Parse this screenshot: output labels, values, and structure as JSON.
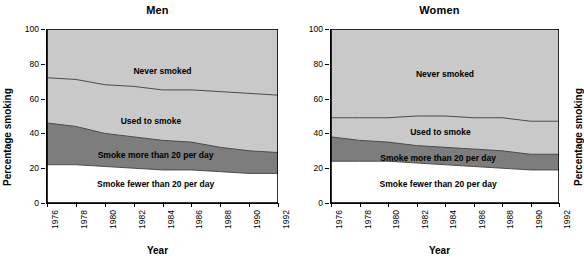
{
  "figure": {
    "width": 569,
    "height": 268,
    "background": "#ffffff"
  },
  "colors": {
    "never_smoked": "#c9c9c9",
    "used_to_smoke": "#c9c9c9",
    "smoke_more_than_20": "#7d7d7d",
    "smoke_fewer_than_20": "#ffffff",
    "axis": "#000000",
    "boundary_line": "#4a4a4a"
  },
  "panels": [
    {
      "id": "men",
      "title": "Men",
      "xlabel": "Year",
      "ylabel": "Percentage smoking"
    },
    {
      "id": "women",
      "title": "Women",
      "xlabel": "Year",
      "ylabel": "Percentage smoking"
    }
  ],
  "axes": {
    "y_ticks": [
      0,
      20,
      40,
      60,
      80,
      100
    ],
    "y_tick_labels": [
      "0",
      "20",
      "40",
      "60",
      "80",
      "100"
    ],
    "ylim": [
      0,
      100
    ],
    "x_ticks": [
      1976,
      1978,
      1980,
      1982,
      1984,
      1986,
      1988,
      1990,
      1992
    ],
    "x_tick_labels": [
      "1976",
      "1978",
      "1980",
      "1982",
      "1984",
      "1986",
      "1988",
      "1990",
      "1992"
    ],
    "xlim": [
      1976,
      1992
    ],
    "grid": false
  },
  "chart_data": [
    {
      "type": "area",
      "title": "Men",
      "xlabel": "Year",
      "ylabel": "Percentage smoking",
      "stacked": true,
      "xlim": [
        1976,
        1992
      ],
      "ylim": [
        0,
        100
      ],
      "grid": false,
      "legend": "inline-band-labels",
      "x": [
        1976,
        1978,
        1980,
        1982,
        1984,
        1986,
        1988,
        1990,
        1992
      ],
      "series": [
        {
          "name": "Smoke fewer than 20 per day",
          "values": [
            22,
            22,
            21,
            20,
            19,
            19,
            18,
            17,
            17
          ],
          "color": "#ffffff"
        },
        {
          "name": "Smoke more than 20 per day",
          "values": [
            24,
            22,
            19,
            18,
            17,
            16,
            14,
            13,
            12
          ],
          "color": "#7d7d7d"
        },
        {
          "name": "Used to smoke",
          "values": [
            26,
            27,
            28,
            29,
            29,
            30,
            32,
            33,
            33
          ],
          "color": "#c9c9c9"
        },
        {
          "name": "Never smoked",
          "values": [
            28,
            29,
            32,
            33,
            35,
            35,
            36,
            37,
            38
          ],
          "color": "#c9c9c9"
        }
      ],
      "cumulative_boundaries": {
        "top_of_smoke_fewer_than_20": [
          22,
          22,
          21,
          20,
          19,
          19,
          18,
          17,
          17
        ],
        "top_of_smoke_more_than_20": [
          46,
          44,
          40,
          38,
          36,
          35,
          32,
          30,
          29
        ],
        "top_of_used_to_smoke": [
          72,
          71,
          68,
          67,
          65,
          65,
          64,
          63,
          62
        ]
      }
    },
    {
      "type": "area",
      "title": "Women",
      "xlabel": "Year",
      "ylabel": "Percentage smoking",
      "stacked": true,
      "xlim": [
        1976,
        1992
      ],
      "ylim": [
        0,
        100
      ],
      "grid": false,
      "legend": "inline-band-labels",
      "x": [
        1976,
        1978,
        1980,
        1982,
        1984,
        1986,
        1988,
        1990,
        1992
      ],
      "series": [
        {
          "name": "Smoke fewer than 20 per day",
          "values": [
            24,
            24,
            24,
            23,
            22,
            21,
            20,
            19,
            19
          ],
          "color": "#ffffff"
        },
        {
          "name": "Smoke more than 20 per day",
          "values": [
            14,
            12,
            11,
            10,
            10,
            10,
            10,
            9,
            9
          ],
          "color": "#7d7d7d"
        },
        {
          "name": "Used to smoke",
          "values": [
            11,
            13,
            14,
            17,
            18,
            18,
            19,
            19,
            19
          ],
          "color": "#c9c9c9"
        },
        {
          "name": "Never smoked",
          "values": [
            51,
            51,
            51,
            50,
            50,
            51,
            51,
            53,
            53
          ],
          "color": "#c9c9c9"
        }
      ],
      "cumulative_boundaries": {
        "top_of_smoke_fewer_than_20": [
          24,
          24,
          24,
          23,
          22,
          21,
          20,
          19,
          19
        ],
        "top_of_smoke_more_than_20": [
          38,
          36,
          35,
          33,
          32,
          31,
          30,
          28,
          28
        ],
        "top_of_used_to_smoke": [
          49,
          49,
          49,
          50,
          50,
          49,
          49,
          47,
          47
        ]
      }
    }
  ],
  "band_labels": {
    "men": {
      "never_smoked": "Never smoked",
      "used_to_smoke": "Used to smoke",
      "smoke_more_than_20": "Smoke more than 20 per day",
      "smoke_fewer_than_20": "Smoke fewer than 20 per day"
    },
    "women": {
      "never_smoked": "Never smoked",
      "used_to_smoke": "Used to smoke",
      "smoke_more_than_20": "Smoke more than 20 per day",
      "smoke_fewer_than_20": "Smoke fewer than 20 per day"
    }
  }
}
